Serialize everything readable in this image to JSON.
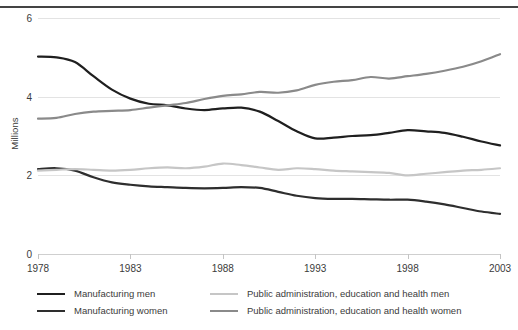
{
  "chart_data": {
    "type": "line",
    "title": "",
    "subtitle": "",
    "xlabel": "",
    "ylabel": "Millions",
    "xlim": [
      1978,
      2003
    ],
    "ylim": [
      0,
      6
    ],
    "grid": true,
    "legend_position": "bottom",
    "x_ticks": [
      "1978",
      "1983",
      "1988",
      "1993",
      "1998",
      "2003"
    ],
    "y_ticks": [
      "0",
      "2",
      "4",
      "6"
    ],
    "x": [
      1978,
      1979,
      1980,
      1981,
      1982,
      1983,
      1984,
      1985,
      1986,
      1987,
      1988,
      1989,
      1990,
      1991,
      1992,
      1993,
      1994,
      1995,
      1996,
      1997,
      1998,
      1999,
      2000,
      2001,
      2002,
      2003
    ],
    "series": [
      {
        "name": "Manufacturing men",
        "color": "#1f1f1f",
        "width": 2.2,
        "values": [
          5.02,
          5.0,
          4.88,
          4.52,
          4.18,
          3.95,
          3.82,
          3.78,
          3.7,
          3.66,
          3.7,
          3.72,
          3.62,
          3.38,
          3.12,
          2.94,
          2.96,
          3.0,
          3.02,
          3.08,
          3.15,
          3.12,
          3.08,
          2.98,
          2.86,
          2.76
        ]
      },
      {
        "name": "Manufacturing women",
        "color": "#2e2e2e",
        "width": 2.2,
        "values": [
          2.16,
          2.18,
          2.12,
          1.95,
          1.82,
          1.76,
          1.72,
          1.7,
          1.68,
          1.67,
          1.68,
          1.7,
          1.68,
          1.58,
          1.48,
          1.42,
          1.4,
          1.4,
          1.39,
          1.38,
          1.38,
          1.33,
          1.26,
          1.17,
          1.08,
          1.02
        ]
      },
      {
        "name": "Public administration, education and health men",
        "color": "#c6c6c6",
        "width": 2.2,
        "values": [
          2.12,
          2.14,
          2.16,
          2.14,
          2.12,
          2.14,
          2.18,
          2.2,
          2.18,
          2.22,
          2.3,
          2.26,
          2.2,
          2.14,
          2.18,
          2.16,
          2.12,
          2.1,
          2.08,
          2.06,
          2.0,
          2.04,
          2.08,
          2.12,
          2.14,
          2.18
        ]
      },
      {
        "name": "Public administration, education and health women",
        "color": "#8a8a8a",
        "width": 2.2,
        "values": [
          3.44,
          3.46,
          3.56,
          3.62,
          3.64,
          3.66,
          3.72,
          3.78,
          3.84,
          3.94,
          4.02,
          4.06,
          4.12,
          4.1,
          4.16,
          4.3,
          4.38,
          4.42,
          4.5,
          4.46,
          4.52,
          4.58,
          4.66,
          4.76,
          4.9,
          5.08
        ]
      }
    ]
  },
  "legend": {
    "items": [
      {
        "label": "Manufacturing men",
        "color": "#1f1f1f",
        "col": 0,
        "row": 0
      },
      {
        "label": "Manufacturing women",
        "color": "#2e2e2e",
        "col": 0,
        "row": 1
      },
      {
        "label": "Public administration, education and health men",
        "color": "#c6c6c6",
        "col": 1,
        "row": 0
      },
      {
        "label": "Public administration, education and health women",
        "color": "#8a8a8a",
        "col": 1,
        "row": 1
      }
    ]
  }
}
